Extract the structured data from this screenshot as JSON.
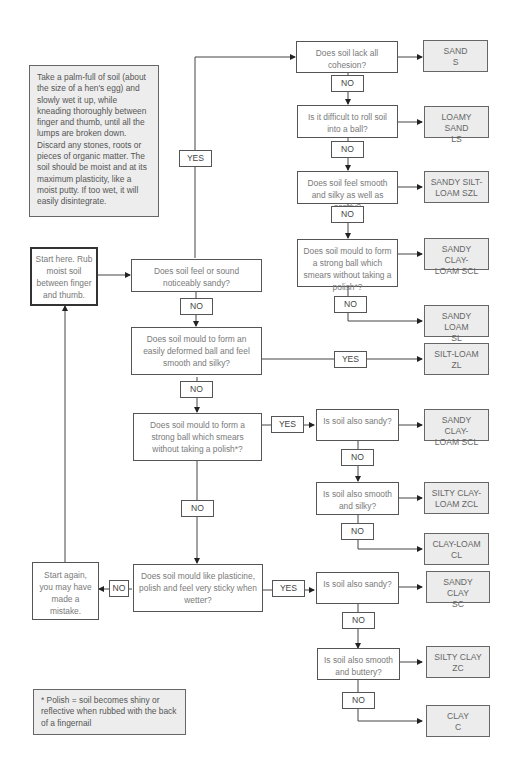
{
  "instructions_note": "Take a palm-full of soil (about the size of a hen's egg) and slowly wet it up, while kneading thoroughly between finger and thumb, until all the lumps are broken down. Discard any stones, roots or pieces of organic matter. The soil should be moist and at its maximum plasticity, like a moist putty. If too wet, it will easily disintegrate.",
  "footnote": "* Polish = soil becomes shiny or reflective when rubbed with the back of a fingernail",
  "start_box": "Start here. Rub moist soil between finger and thumb.",
  "restart_box": "Start again, you may have made a mistake.",
  "main_questions": [
    "Does soil feel or sound noticeably sandy?",
    "Does soil mould to form an easily deformed ball and feel smooth and silky?",
    "Does soil mould to form a strong ball which smears without taking a polish*?",
    "Does soil mould like plasticine, polish and feel very sticky when wetter?"
  ],
  "sandy_branch_questions": [
    "Does soil lack all cohesion?",
    "Is it difficult to roll soil into a ball?",
    "Does soil feel smooth and silky as well as sandy?",
    "Does soil mould to form a strong ball which smears without taking a polish*?"
  ],
  "clay_loam_branch_questions": [
    "Is soil also sandy?",
    "Is soil also smooth and silky?"
  ],
  "clay_branch_questions": [
    "Is soil also sandy?",
    "Is soil also smooth and buttery?"
  ],
  "results": {
    "sand": "SAND\nS",
    "loamy_sand": "LOAMY SAND\nLS",
    "sandy_silt_loam": "SANDY SILT-\nLOAM SZL",
    "sandy_clay_loam_1": "SANDY CLAY-\nLOAM SCL",
    "sandy_loam": "SANDY LOAM\nSL",
    "silt_loam": "SILT-LOAM\nZL",
    "sandy_clay_loam_2": "SANDY CLAY-\nLOAM SCL",
    "silty_clay_loam": "SILTY CLAY-\nLOAM ZCL",
    "clay_loam": "CLAY-LOAM\nCL",
    "sandy_clay": "SANDY CLAY\nSC",
    "silty_clay": "SILTY CLAY\nZC",
    "clay": "CLAY\nC"
  },
  "labels": {
    "yes": "YES",
    "no": "NO"
  },
  "colors": {
    "result_fill": "#ececec",
    "note_fill": "#ededed",
    "line": "#333333",
    "text": "#7a7a7a"
  }
}
